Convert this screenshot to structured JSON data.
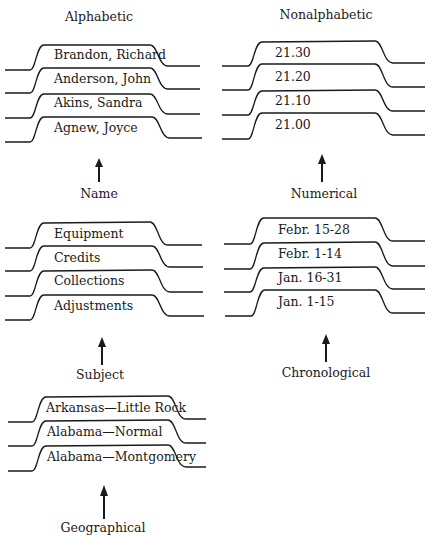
{
  "left_column": {
    "heading": "Alphabetic",
    "groups": [
      {
        "caption": "Name",
        "tabs": [
          "Brandon, Richard",
          "Anderson, John",
          "Akins, Sandra",
          "Agnew, Joyce"
        ]
      },
      {
        "caption": "Subject",
        "tabs": [
          "Equipment",
          "Credits",
          "Collections",
          "Adjustments"
        ]
      },
      {
        "caption": "Geographical",
        "tabs": [
          "Arkansas—Little Rock",
          "Alabama—Normal",
          "Alabama—Montgomery"
        ]
      }
    ]
  },
  "right_column": {
    "heading": "Nonalphabetic",
    "groups": [
      {
        "caption": "Numerical",
        "tabs": [
          "21.30",
          "21.20",
          "21.10",
          "21.00"
        ]
      },
      {
        "caption": "Chronological",
        "tabs": [
          "Febr. 15-28",
          "Febr. 1-14",
          "Jan. 16-31",
          "Jan. 1-15"
        ]
      }
    ]
  },
  "colors": {
    "line": "#1a1a1a",
    "background": "#ffffff"
  }
}
